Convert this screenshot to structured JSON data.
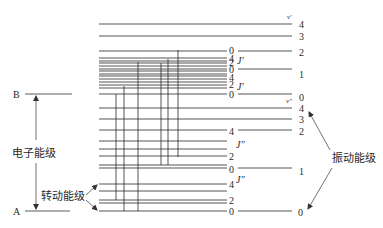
{
  "diagram": {
    "title": "",
    "electronic_states": [
      {
        "id": "B",
        "label": "B"
      },
      {
        "id": "A",
        "label": "A"
      }
    ],
    "labels": {
      "electronic_level": "电子能级",
      "rotational_level": "转动能级",
      "vibrational_level": "振动能级",
      "upper_vib_symbol": "ν′",
      "lower_vib_symbol": "ν″",
      "upper_rot_symbol": "J′",
      "lower_rot_symbol": "J″"
    },
    "upper_state": {
      "vibrational_levels": [
        "0",
        "1",
        "2",
        "3",
        "4"
      ],
      "rotational_groups": [
        {
          "vib": "2",
          "rot_labels": [
            "0"
          ]
        },
        {
          "vib": "1",
          "rot_labels": [
            "4",
            "2",
            "0"
          ]
        },
        {
          "vib": "0",
          "rot_labels": [
            "4",
            "2",
            "0"
          ]
        }
      ]
    },
    "lower_state": {
      "vibrational_levels": [
        "0",
        "1",
        "2",
        "3",
        "4"
      ],
      "rotational_groups": [
        {
          "vib": "2",
          "rot_labels": [
            "4"
          ]
        },
        {
          "vib": "1",
          "rot_labels": [
            "2",
            "0"
          ]
        },
        {
          "vib": "0",
          "rot_labels": [
            "4",
            "2",
            "0"
          ]
        }
      ]
    },
    "transitions_count": 6
  }
}
